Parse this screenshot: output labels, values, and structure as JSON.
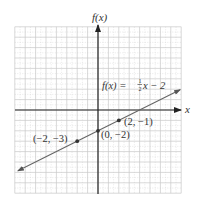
{
  "chart_data": {
    "type": "line",
    "title": "",
    "xlabel": "x",
    "ylabel": "f(x)",
    "xlim": [
      -8,
      8
    ],
    "ylim": [
      -8,
      8
    ],
    "grid": true,
    "grid_major_step": 1,
    "grid_minor_step": 0.5,
    "legend": null,
    "series": [
      {
        "name": "f(x) = ½x − 2",
        "function": "0.5*x - 2",
        "slope": 0.5,
        "intercept": -2,
        "x_range": [
          -7.7,
          7.9
        ],
        "arrows": "both"
      }
    ],
    "points": [
      {
        "x": -2,
        "y": -3,
        "label": "(−2, −3)"
      },
      {
        "x": 0,
        "y": -2,
        "label": "(0, −2)"
      },
      {
        "x": 2,
        "y": -1,
        "label": "(2, −1)"
      }
    ],
    "annotations": [
      {
        "text": "f(x) = ½x − 2",
        "near": [
          3.5,
          2.5
        ]
      }
    ]
  },
  "labels": {
    "y_axis": "f(x)",
    "x_axis": "x",
    "equation_lhs": "f(x) = ",
    "equation_num": "1",
    "equation_den": "2",
    "equation_rhs": "x − 2",
    "point_a": "(−2, −3)",
    "point_b": "(0, −2)",
    "point_c": "(2, −1)"
  },
  "colors": {
    "axis": "#222222",
    "line": "#666666",
    "grid_major": "#c8c8c8",
    "grid_minor": "#d8d8d8",
    "point": "#333333",
    "text": "#333333"
  }
}
